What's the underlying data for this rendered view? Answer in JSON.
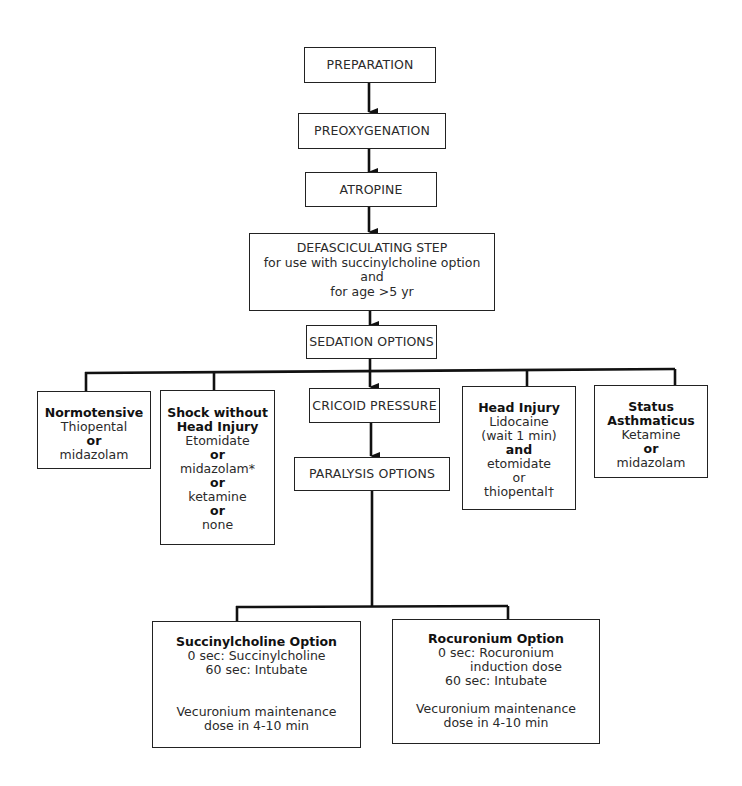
{
  "flowchart": {
    "steps": {
      "preparation": "PREPARATION",
      "preoxygenation": "PREOXYGENATION",
      "atropine": "ATROPINE",
      "defasciculating": {
        "title": "DEFASCICULATING STEP",
        "line1": "for use with succinylcholine option",
        "line2": "and",
        "line3": "for age >5 yr"
      },
      "sedation": "SEDATION OPTIONS",
      "cricoid": "CRICOID PRESSURE",
      "paralysis": "PARALYSIS OPTIONS"
    },
    "sedation_options": {
      "normotensive": {
        "title": "Normotensive",
        "lines": [
          "Thiopental",
          "or",
          "midazolam"
        ]
      },
      "shock": {
        "title1": "Shock without",
        "title2": "Head Injury",
        "lines": [
          "Etomidate",
          "or",
          "midazolam*",
          "or",
          "ketamine",
          "or",
          "none"
        ]
      },
      "head_injury": {
        "title": "Head Injury",
        "lines": [
          "Lidocaine",
          "(wait 1 min)",
          "and",
          "etomidate",
          "or",
          "thiopental†"
        ]
      },
      "status_asthmaticus": {
        "title1": "Status",
        "title2": "Asthmaticus",
        "lines": [
          "Ketamine",
          "or",
          "midazolam"
        ]
      }
    },
    "paralysis_options": {
      "succinylcholine": {
        "title": "Succinylcholine Option",
        "line1": "0 sec: Succinylcholine",
        "line2": "60 sec: Intubate",
        "maint1": "Vecuronium maintenance",
        "maint2": "dose in 4-10 min"
      },
      "rocuronium": {
        "title": "Rocuronium Option",
        "line1": "0 sec: Rocuronium",
        "line1b": "induction dose",
        "line2": "60 sec: Intubate",
        "maint1": "Vecuronium maintenance",
        "maint2": "dose in 4-10 min"
      }
    }
  }
}
